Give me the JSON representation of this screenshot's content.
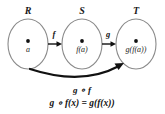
{
  "diagram": {
    "sets": [
      {
        "name": "R",
        "label": "R",
        "element": "a",
        "cx": 28,
        "cy": 44
      },
      {
        "name": "S",
        "label": "S",
        "element": "f(a)",
        "cx": 82,
        "cy": 44
      },
      {
        "name": "T",
        "label": "T",
        "element": "g(f(a))",
        "cx": 136,
        "cy": 44
      }
    ],
    "arrows": [
      {
        "name": "f-arrow",
        "label": "f",
        "from": "R",
        "to": "S"
      },
      {
        "name": "g-arrow",
        "label": "g",
        "from": "S",
        "to": "T"
      },
      {
        "name": "composition-arrow",
        "label": "",
        "from": "R",
        "to": "T"
      }
    ],
    "composition_label": "g ∘ f",
    "formula": "g ∘ f(x) = g(f(x))",
    "colors": {
      "background": "#ffffff",
      "ellipse_stroke": "#8a8a8a",
      "text": "#111111",
      "arrow": "#111111"
    }
  }
}
